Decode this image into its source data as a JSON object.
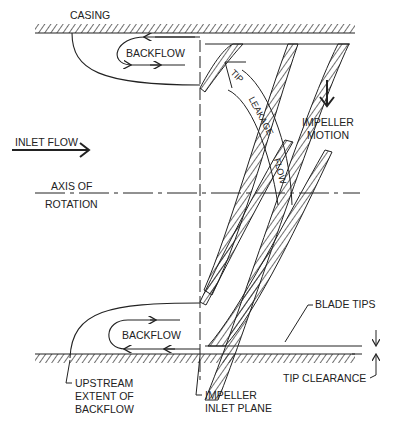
{
  "diagram": {
    "type": "inducer backflow / tip leakage schematic",
    "labels": {
      "casing": "CASING",
      "backflow_top": "BACKFLOW",
      "backflow_bottom": "BACKFLOW",
      "inlet_flow": "INLET FLOW",
      "axis_line1": "AXIS OF",
      "axis_line2": "ROTATION",
      "tip": "TIP",
      "leakage": "LEAKAGE",
      "flow": "FLOW",
      "impeller_motion_line1": "IMPELLER",
      "impeller_motion_line2": "MOTION",
      "blade_tips": "BLADE TIPS",
      "tip_clearance": "TIP CLEARANCE",
      "upstream_line1": "UPSTREAM",
      "upstream_line2": "EXTENT OF",
      "upstream_line3": "BACKFLOW",
      "inlet_plane_line1": "IMPELLER",
      "inlet_plane_line2": "INLET PLANE"
    },
    "colors": {
      "ink": "#222222",
      "background": "#ffffff"
    }
  }
}
